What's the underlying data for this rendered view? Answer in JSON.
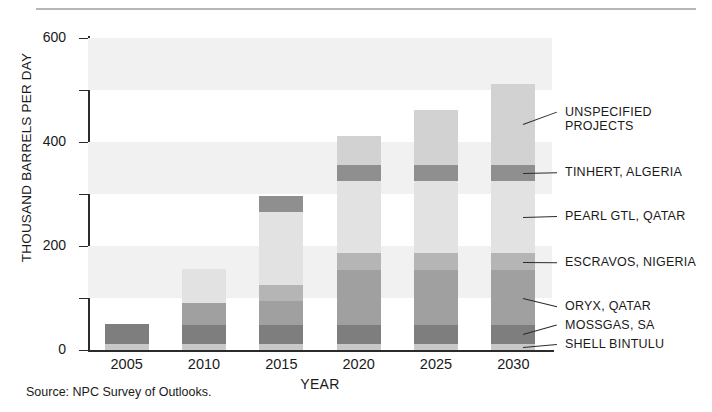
{
  "figure": {
    "source_note": "Source:  NPC Survey of Outlooks."
  },
  "axes": {
    "y_title": "THOUSAND BARRELS PER DAY",
    "x_title": "YEAR",
    "y_ticks": [
      "0",
      "200",
      "400",
      "600"
    ],
    "y_minor_ticks": [
      "100",
      "300",
      "500"
    ],
    "x_ticks": [
      "2005",
      "2010",
      "2015",
      "2020",
      "2025",
      "2030"
    ]
  },
  "legend": [
    {
      "label": "UNSPECIFIED\nPROJECTS",
      "color": "#d2d2d2"
    },
    {
      "label": "TINHERT, ALGERIA",
      "color": "#8f8f8f"
    },
    {
      "label": "PEARL GTL, QATAR",
      "color": "#e2e2e2"
    },
    {
      "label": "ESCRAVOS, NIGERIA",
      "color": "#b5b5b5"
    },
    {
      "label": "ORYX, QATAR",
      "color": "#a0a0a0"
    },
    {
      "label": "MOSSGAS, SA",
      "color": "#7e7e7e"
    },
    {
      "label": "SHELL BINTULU",
      "color": "#c8c8c8"
    }
  ],
  "chart_data": {
    "type": "bar",
    "title": "",
    "subtitle": "",
    "stacked": true,
    "xlabel": "YEAR",
    "ylabel": "THOUSAND BARRELS PER DAY",
    "ylim": [
      0,
      600
    ],
    "ytick_step": 100,
    "ylabeled_step": 200,
    "grid": "horizontal-bands",
    "legend_position": "right-with-leader-lines",
    "categories": [
      "2005",
      "2010",
      "2015",
      "2020",
      "2025",
      "2030"
    ],
    "series": [
      {
        "name": "SHELL BINTULU",
        "color": "#c8c8c8",
        "values": [
          12,
          12,
          12,
          12,
          12,
          12
        ]
      },
      {
        "name": "MOSSGAS, SA",
        "color": "#7e7e7e",
        "values": [
          38,
          36,
          36,
          36,
          36,
          36
        ]
      },
      {
        "name": "ORYX, QATAR",
        "color": "#a0a0a0",
        "values": [
          0,
          42,
          46,
          105,
          105,
          105
        ]
      },
      {
        "name": "ESCRAVOS, NIGERIA",
        "color": "#b5b5b5",
        "values": [
          0,
          0,
          32,
          33,
          33,
          33
        ]
      },
      {
        "name": "PEARL GTL, QATAR",
        "color": "#e2e2e2",
        "values": [
          0,
          65,
          140,
          140,
          140,
          140
        ]
      },
      {
        "name": "TINHERT, ALGERIA",
        "color": "#8f8f8f",
        "values": [
          0,
          0,
          30,
          30,
          30,
          30
        ]
      },
      {
        "name": "UNSPECIFIED PROJECTS",
        "color": "#d2d2d2",
        "values": [
          0,
          0,
          0,
          56,
          106,
          156
        ]
      }
    ],
    "totals": [
      50,
      155,
      296,
      412,
      462,
      512
    ]
  }
}
